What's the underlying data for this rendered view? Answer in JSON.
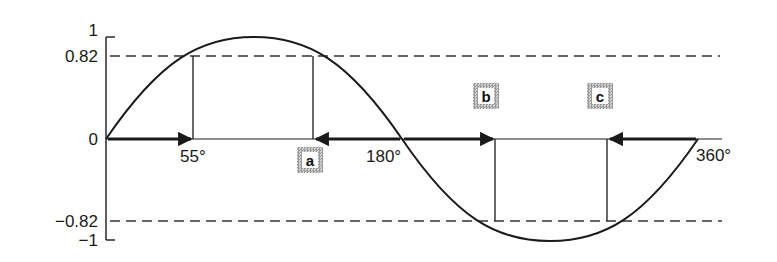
{
  "diagram": {
    "title": "",
    "y_ticks": [
      {
        "label": "1",
        "value": 1
      },
      {
        "label": "0.82",
        "value": 0.82
      },
      {
        "label": "0",
        "value": 0
      },
      {
        "label": "−0.82",
        "value": -0.82
      },
      {
        "label": "−1",
        "value": -1
      }
    ],
    "x_labels": {
      "a55": "55°",
      "a180": "180°",
      "a360": "360°"
    },
    "markers": {
      "a": "a",
      "b": "b",
      "c": "c"
    },
    "curve": "sine, 0° to 360°",
    "reference_level": 0.82,
    "solution_angles": {
      "x1": "55°",
      "a": "a",
      "b": "b",
      "c": "c"
    },
    "colors": {
      "line": "#1a1a1a",
      "dashed": "#333333",
      "marker_fill": "#b0b0b0"
    }
  }
}
